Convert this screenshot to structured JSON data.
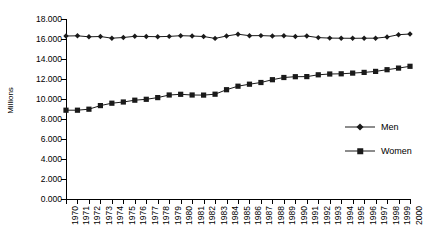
{
  "chart_data": {
    "type": "line",
    "title": "",
    "xlabel": "",
    "ylabel": "Millions",
    "ylim": [
      0,
      18000
    ],
    "ytick_step": 2000,
    "grid": false,
    "legend_position": "right",
    "decimal_separator": ".",
    "ytick_labels": [
      "0.000",
      "2.000",
      "4.000",
      "6.000",
      "8.000",
      "10.000",
      "12.000",
      "14.000",
      "16.000",
      "18.000"
    ],
    "ytick_values": [
      0,
      2000,
      4000,
      6000,
      8000,
      10000,
      12000,
      14000,
      16000,
      18000
    ],
    "categories": [
      "1970",
      "1971",
      "1972",
      "1973",
      "1974",
      "1975",
      "1976",
      "1977",
      "1978",
      "1979",
      "1980",
      "1981",
      "1982",
      "1983",
      "1984",
      "1985",
      "1986",
      "1987",
      "1988",
      "1989",
      "1990",
      "1991",
      "1992",
      "1993",
      "1994",
      "1995",
      "1996",
      "1997",
      "1998",
      "1999",
      "2000"
    ],
    "series": [
      {
        "name": "Men",
        "marker": "diamond",
        "color": "#1a1a1a",
        "values": [
          16300,
          16320,
          16220,
          16250,
          16080,
          16150,
          16270,
          16250,
          16230,
          16260,
          16330,
          16300,
          16250,
          16060,
          16300,
          16480,
          16330,
          16340,
          16300,
          16320,
          16250,
          16300,
          16140,
          16090,
          16080,
          16070,
          16080,
          16080,
          16200,
          16430,
          16500
        ]
      },
      {
        "name": "Women",
        "marker": "square",
        "color": "#1a1a1a",
        "values": [
          8880,
          8880,
          8980,
          9340,
          9580,
          9700,
          9880,
          9970,
          10140,
          10400,
          10470,
          10400,
          10390,
          10480,
          10930,
          11280,
          11480,
          11650,
          11930,
          12150,
          12230,
          12240,
          12420,
          12500,
          12520,
          12590,
          12660,
          12760,
          12930,
          13090,
          13270
        ]
      }
    ]
  },
  "legend": {
    "items": [
      {
        "label": "Men"
      },
      {
        "label": "Women"
      }
    ]
  }
}
